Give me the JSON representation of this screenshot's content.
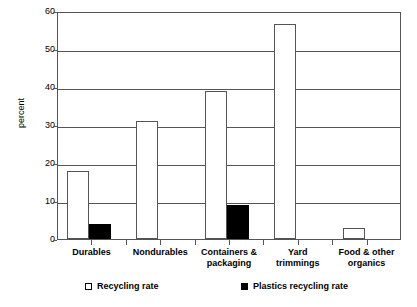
{
  "chart_data": {
    "type": "bar",
    "title": "",
    "xlabel": "",
    "ylabel": "percent",
    "ylim": [
      0,
      60
    ],
    "ytick_step": 10,
    "yticks": [
      0,
      10,
      20,
      30,
      40,
      50,
      60
    ],
    "ytick_labels": [
      "0",
      "10",
      "20",
      "30",
      "40",
      "50",
      "60"
    ],
    "grid": true,
    "legend_position": "bottom",
    "categories": [
      "Durables",
      "Nondurables",
      "Containers &\npackaging",
      "Yard\ntrimmings",
      "Food & other\norganics"
    ],
    "series": [
      {
        "name": "Recycling rate",
        "style": "open",
        "color": "#ffffff",
        "edge_color": "#555555",
        "values": [
          18.0,
          31.0,
          39.0,
          56.5,
          2.8
        ]
      },
      {
        "name": "Plastics recycling rate",
        "style": "filled",
        "color": "#000000",
        "edge_color": "#000000",
        "values": [
          4.0,
          0,
          9.0,
          0,
          0
        ]
      }
    ]
  },
  "legend": {
    "entries": [
      {
        "label": "Recycling rate",
        "style": "open"
      },
      {
        "label": "Plastics recycling rate",
        "style": "filled"
      }
    ]
  }
}
